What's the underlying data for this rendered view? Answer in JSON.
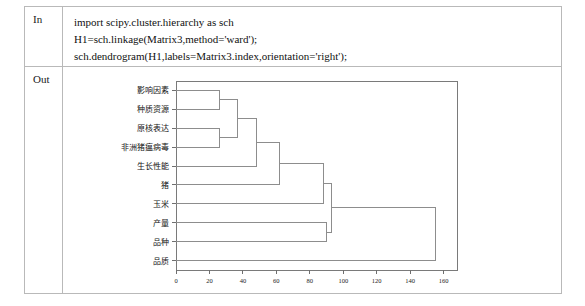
{
  "notebook": {
    "in_label": "In",
    "out_label": "Out",
    "code_lines": [
      "import scipy.cluster.hierarchy as sch",
      "H1=sch.linkage(Matrix3,method='ward');",
      "sch.dendrogram(H1,labels=Matrix3.index,orientation='right');"
    ]
  },
  "chart_data": {
    "type": "dendrogram",
    "title": "",
    "xlabel": "",
    "ylabel": "",
    "orientation": "right",
    "linkage_method": "ward",
    "xlim": [
      0,
      168
    ],
    "xticks": [
      0,
      20,
      40,
      60,
      80,
      100,
      120,
      140,
      160
    ],
    "xticklabels": [
      "0",
      "20",
      "40",
      "60",
      "80",
      "100",
      "120",
      "140",
      "160"
    ],
    "grid": false,
    "legend": null,
    "leaf_labels": [
      "影响因素",
      "种质资源",
      "原核表达",
      "非洲猪瘟病毒",
      "生长性能",
      "猪",
      "玉米",
      "产量",
      "品种",
      "品质"
    ],
    "merges": [
      {
        "id": "m1",
        "children": [
          "影响因素",
          "种质资源"
        ],
        "height": 26
      },
      {
        "id": "m2",
        "children": [
          "原核表达",
          "非洲猪瘟病毒"
        ],
        "height": 26
      },
      {
        "id": "m3",
        "children": [
          "m1",
          "m2"
        ],
        "height": 37
      },
      {
        "id": "m4",
        "children": [
          "m3",
          "生长性能"
        ],
        "height": 48
      },
      {
        "id": "m5",
        "children": [
          "m4",
          "猪"
        ],
        "height": 62
      },
      {
        "id": "m6",
        "children": [
          "m5",
          "玉米"
        ],
        "height": 88
      },
      {
        "id": "m7",
        "children": [
          "产量",
          "品种"
        ],
        "height": 90
      },
      {
        "id": "m8",
        "children": [
          "m6",
          "m7"
        ],
        "height": 93
      },
      {
        "id": "m9",
        "children": [
          "m8",
          "品质"
        ],
        "height": 155
      }
    ]
  },
  "colors": {
    "link": "#8d8d8d",
    "frame": "#7a7a7a",
    "table_border": "#b9b9b9",
    "text": "#111111",
    "background": "#ffffff"
  }
}
